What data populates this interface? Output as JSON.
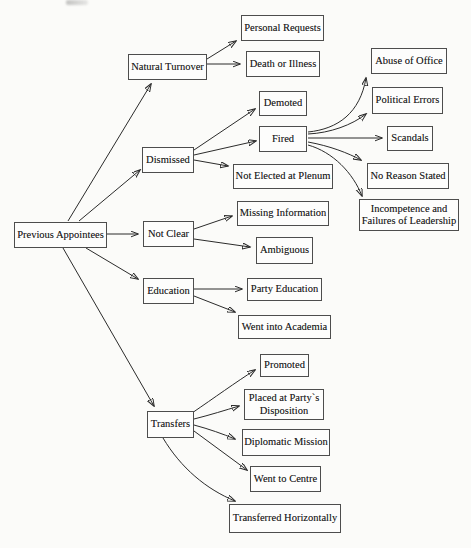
{
  "diagram": {
    "type": "flowchart",
    "root_label": "Previous Appointees",
    "colors": {
      "ink": "#2b2b2b",
      "box_border": "#4d4d4d",
      "paper": "#fbfbf9",
      "text": "#1d1d1d"
    },
    "nodes": [
      {
        "id": "previous-appointees",
        "label": "Previous Appointees"
      },
      {
        "id": "natural-turnover",
        "label": "Natural Turnover"
      },
      {
        "id": "dismissed",
        "label": "Dismissed"
      },
      {
        "id": "not-clear",
        "label": "Not Clear"
      },
      {
        "id": "education",
        "label": "Education"
      },
      {
        "id": "transfers",
        "label": "Transfers"
      },
      {
        "id": "personal-requests",
        "label": "Personal Requests"
      },
      {
        "id": "death-or-illness",
        "label": "Death or Illness"
      },
      {
        "id": "demoted",
        "label": "Demoted"
      },
      {
        "id": "fired",
        "label": "Fired"
      },
      {
        "id": "not-elected-at-plenum",
        "label": "Not Elected at Plenum"
      },
      {
        "id": "abuse-of-office",
        "label": "Abuse of Office"
      },
      {
        "id": "political-errors",
        "label": "Political Errors"
      },
      {
        "id": "scandals",
        "label": "Scandals"
      },
      {
        "id": "no-reason-stated",
        "label": "No Reason Stated"
      },
      {
        "id": "incompetence-failures",
        "label": "Incompetence and\nFailures of Leadership"
      },
      {
        "id": "missing-information",
        "label": "Missing Information"
      },
      {
        "id": "ambiguous",
        "label": "Ambiguous"
      },
      {
        "id": "party-education",
        "label": "Party Education"
      },
      {
        "id": "went-into-academia",
        "label": "Went into Academia"
      },
      {
        "id": "promoted",
        "label": "Promoted"
      },
      {
        "id": "placed-at-partys-disposition",
        "label": "Placed at Party`s\nDisposition"
      },
      {
        "id": "diplomatic-mission",
        "label": "Diplomatic Mission"
      },
      {
        "id": "went-to-centre",
        "label": "Went to Centre"
      },
      {
        "id": "transferred-horizontally",
        "label": "Transferred Horizontally"
      }
    ],
    "edges": [
      {
        "from": "previous-appointees",
        "to": "natural-turnover"
      },
      {
        "from": "previous-appointees",
        "to": "dismissed"
      },
      {
        "from": "previous-appointees",
        "to": "not-clear"
      },
      {
        "from": "previous-appointees",
        "to": "education"
      },
      {
        "from": "previous-appointees",
        "to": "transfers"
      },
      {
        "from": "natural-turnover",
        "to": "personal-requests"
      },
      {
        "from": "natural-turnover",
        "to": "death-or-illness"
      },
      {
        "from": "dismissed",
        "to": "demoted"
      },
      {
        "from": "dismissed",
        "to": "fired"
      },
      {
        "from": "dismissed",
        "to": "not-elected-at-plenum"
      },
      {
        "from": "fired",
        "to": "abuse-of-office"
      },
      {
        "from": "fired",
        "to": "political-errors"
      },
      {
        "from": "fired",
        "to": "scandals"
      },
      {
        "from": "fired",
        "to": "no-reason-stated"
      },
      {
        "from": "fired",
        "to": "incompetence-failures"
      },
      {
        "from": "not-clear",
        "to": "missing-information"
      },
      {
        "from": "not-clear",
        "to": "ambiguous"
      },
      {
        "from": "education",
        "to": "party-education"
      },
      {
        "from": "education",
        "to": "went-into-academia"
      },
      {
        "from": "transfers",
        "to": "promoted"
      },
      {
        "from": "transfers",
        "to": "placed-at-partys-disposition"
      },
      {
        "from": "transfers",
        "to": "diplomatic-mission"
      },
      {
        "from": "transfers",
        "to": "went-to-centre"
      },
      {
        "from": "transfers",
        "to": "transferred-horizontally"
      }
    ]
  }
}
